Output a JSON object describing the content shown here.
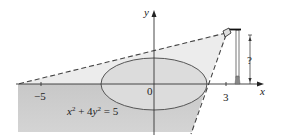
{
  "figure": {
    "type": "ellipse-shadow-diagram",
    "equation": "x² + 4y² = 5",
    "equation_parts": {
      "x": "x",
      "sup2a": "2",
      "plus": " + 4",
      "y": "y",
      "sup2b": "2",
      "eq": " = 5"
    },
    "axes": {
      "x_label": "x",
      "y_label": "y",
      "tick_labels": {
        "neg5": "−5",
        "zero": "0",
        "three": "3"
      }
    },
    "lamp": {
      "height_label": "?"
    },
    "colors": {
      "shadow_dark": "#c4c4c4",
      "shadow_light": "#e6e6e6",
      "ellipse_fill": "#d9d9d9",
      "stroke": "#555555",
      "axis": "#333333"
    }
  }
}
